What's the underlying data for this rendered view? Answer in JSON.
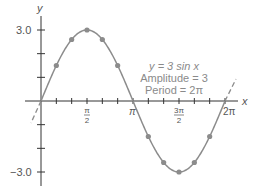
{
  "chart_data": {
    "type": "line",
    "title": "",
    "function": "y = 3 sin x",
    "xlabel": "x",
    "ylabel": "y",
    "xlim": [
      -0.4,
      7.0
    ],
    "ylim": [
      -3.0,
      3.0
    ],
    "x_tick_labels": [
      "π/2",
      "π",
      "3π/2",
      "2π"
    ],
    "x_tick_values": [
      1.5708,
      3.1416,
      4.7124,
      6.2832
    ],
    "x_minor_tick_step": "π/6",
    "y_tick_labels": [
      "3.0",
      "−3.0"
    ],
    "y_tick_values": [
      3.0,
      1.0,
      2.0,
      -1.0,
      -2.0,
      -3.0
    ],
    "series": [
      {
        "name": "y = 3 sin x",
        "x": [
          0,
          0.5236,
          1.0472,
          1.5708,
          2.0944,
          2.618,
          3.1416,
          3.6652,
          4.1888,
          4.7124,
          5.236,
          5.7596,
          6.2832
        ],
        "values": [
          0,
          1.5,
          2.598,
          3.0,
          2.598,
          1.5,
          0,
          -1.5,
          -2.598,
          -3.0,
          -2.598,
          -1.5,
          0
        ]
      }
    ],
    "annotations": [
      "y = 3 sin x",
      "Amplitude = 3",
      "Period = 2π"
    ],
    "grid": false,
    "legend": "none",
    "extensions": "dashed continuation beyond [0, 2π]"
  },
  "labels": {
    "y_axis": "y",
    "x_axis": "x",
    "y_top": "3.0",
    "y_bottom": "−3.0",
    "x_pi_half_num": "π",
    "x_pi_half_den": "2",
    "x_pi": "π",
    "x_three_pi_half_num": "3π",
    "x_three_pi_half_den": "2",
    "x_two_pi": "2π",
    "annot_line1": "y = 3 sin x",
    "annot_line2": "Amplitude = 3",
    "annot_line3": "Period = 2π"
  },
  "colors": {
    "curve": "#8c8c8c",
    "dots": "#8c8c8c",
    "axes": "#333333",
    "text": "#555555"
  }
}
